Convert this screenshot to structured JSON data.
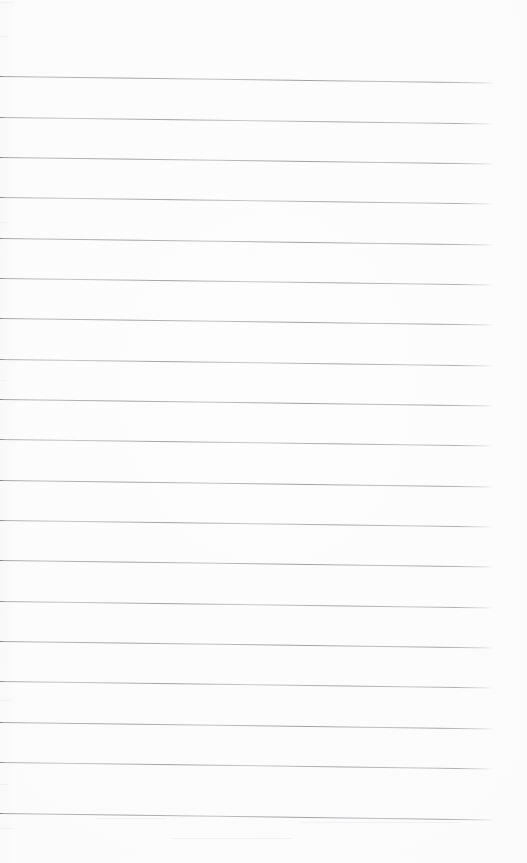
{
  "document": {
    "kind": "scanned-ruled-paper",
    "title": "Blank lined notebook page",
    "page_width": 527,
    "page_height": 863,
    "background_color": "#fdfdfd",
    "has_text": false,
    "visible_text": "",
    "notes": "Scanned sheet of blank ruled paper. No headings, labels, numbers, icons or controls are present in the pixels."
  },
  "ruling": {
    "line_color": "#9e9e9e",
    "line_thickness_px": 1,
    "line_count": 19,
    "line_start_x": 0,
    "line_end_x": 494,
    "line_length_px": 494,
    "first_line_y": 76,
    "last_line_y": 813,
    "line_spacing_px": 40.4,
    "skew_degrees": 0.75,
    "right_margin_px": 33,
    "top_margin_px": 76,
    "bottom_margin_px": 50,
    "lines": [
      {
        "index": 1,
        "y": 76
      },
      {
        "index": 2,
        "y": 117
      },
      {
        "index": 3,
        "y": 157
      },
      {
        "index": 4,
        "y": 197
      },
      {
        "index": 5,
        "y": 238
      },
      {
        "index": 6,
        "y": 278
      },
      {
        "index": 7,
        "y": 318
      },
      {
        "index": 8,
        "y": 359
      },
      {
        "index": 9,
        "y": 399
      },
      {
        "index": 10,
        "y": 439
      },
      {
        "index": 11,
        "y": 480
      },
      {
        "index": 12,
        "y": 520
      },
      {
        "index": 13,
        "y": 560
      },
      {
        "index": 14,
        "y": 601
      },
      {
        "index": 15,
        "y": 641
      },
      {
        "index": 16,
        "y": 681
      },
      {
        "index": 17,
        "y": 722
      },
      {
        "index": 18,
        "y": 762
      },
      {
        "index": 19,
        "y": 813
      }
    ]
  }
}
